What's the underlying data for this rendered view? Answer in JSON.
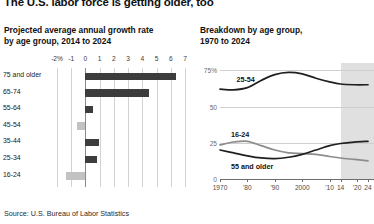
{
  "headline": "The U.S. labor force is getting older, too",
  "source": "Source: U.S. Bureau of Labor Statistics",
  "left_panel": {
    "title_line1": "Projected average annual growth rate",
    "title_line2": "by age group, 2014 to 2024"
  },
  "right_panel": {
    "title_line1": "Breakdown by age group,",
    "title_line2": "1970 to 2024"
  },
  "colors": {
    "bar_positive": "#3d3d3d",
    "bar_negative": "#c2c2c2",
    "line_dark": "#1f1f1f",
    "line_gray": "#8c8c8c",
    "projection_band": "#dadada",
    "gridline": "#d2d2d2"
  },
  "chart_data": [
    {
      "type": "bar",
      "orientation": "horizontal",
      "title": "Projected average annual growth rate by age group, 2014 to 2024",
      "xlabel": "",
      "ylabel": "",
      "xlim": [
        -2,
        7
      ],
      "grid": true,
      "xticks": [
        -2,
        -1,
        0,
        1,
        2,
        3,
        4,
        5,
        6,
        7
      ],
      "xticklabels": [
        "-2%",
        "-1",
        "0",
        "1",
        "2",
        "3",
        "4",
        "5",
        "6",
        "7"
      ],
      "categories": [
        "75 and older",
        "65-74",
        "55-64",
        "45-54",
        "35-44",
        "25-34",
        "16-24"
      ],
      "values": [
        6.4,
        4.5,
        0.55,
        -0.6,
        0.95,
        0.8,
        -1.4
      ],
      "series": [
        {
          "name": "Average annual growth rate (%)",
          "values": [
            6.4,
            4.5,
            0.55,
            -0.6,
            0.95,
            0.8,
            -1.4
          ]
        }
      ]
    },
    {
      "type": "line",
      "title": "Breakdown by age group, 1970 to 2024",
      "xlabel": "",
      "ylabel": "",
      "xlim": [
        1970,
        2024
      ],
      "ylim": [
        0,
        80
      ],
      "grid": true,
      "yticks": [
        0,
        25,
        50,
        75
      ],
      "yticklabels": [
        "0",
        "25",
        "50",
        "75%"
      ],
      "xticks": [
        1970,
        1980,
        1990,
        2000,
        2010,
        2014,
        2020,
        2024
      ],
      "xticklabels": [
        "1970",
        "'80",
        "'90",
        "2000",
        "'10",
        "14",
        "'20",
        "24"
      ],
      "projection_start": 2014,
      "projection_note": "shaded region = projected",
      "series": [
        {
          "name": "25-54",
          "color": "#1f1f1f",
          "x": [
            1970,
            1975,
            1980,
            1985,
            1990,
            1995,
            2000,
            2005,
            2010,
            2014,
            2019,
            2024
          ],
          "values": [
            62,
            61.5,
            63,
            68,
            72,
            73.5,
            72.5,
            69.5,
            67,
            65.5,
            65,
            65
          ]
        },
        {
          "name": "16-24",
          "color": "#8c8c8c",
          "x": [
            1970,
            1975,
            1980,
            1985,
            1990,
            1995,
            2000,
            2005,
            2010,
            2014,
            2019,
            2024
          ],
          "values": [
            23.5,
            25.5,
            26,
            23,
            20,
            18,
            17.5,
            17,
            15.5,
            14.5,
            13.5,
            12.5
          ]
        },
        {
          "name": "55 and older",
          "color": "#1f1f1f",
          "x": [
            1970,
            1975,
            1980,
            1985,
            1990,
            1995,
            2000,
            2005,
            2010,
            2014,
            2019,
            2024
          ],
          "values": [
            20,
            18,
            16,
            14.5,
            14,
            15,
            17,
            20,
            23,
            24.5,
            25.5,
            26
          ]
        }
      ]
    }
  ]
}
